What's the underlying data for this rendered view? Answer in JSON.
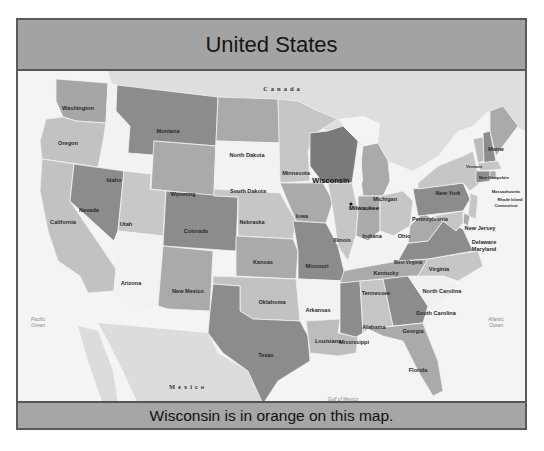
{
  "title": "United States",
  "caption": "Wisconsin is in orange on this map.",
  "highlight": {
    "state": "Wisconsin",
    "city": "Milwaukee"
  },
  "colors": {
    "frame_band": "#a3a3a3",
    "water": "#f4f4f4",
    "land_foreign": "#dcdcdc",
    "highlight": "#7a7a7a",
    "dark": "#8c8c8c",
    "mid": "#aaaaaa",
    "light": "#c4c4c4",
    "pale": "#f0f0f0"
  },
  "labels": {
    "countries": {
      "canada": "Canada",
      "mexico": "Mexico"
    },
    "water": {
      "pacific_1": "Pacific",
      "pacific_2": "Ocean",
      "atlantic_1": "Atlantic",
      "atlantic_2": "Ocean",
      "gulf": "Gulf of Mexico"
    },
    "states": {
      "washington": "Washington",
      "oregon": "Oregon",
      "california": "California",
      "idaho": "Idaho",
      "nevada": "Nevada",
      "utah": "Utah",
      "arizona": "Arizona",
      "montana": "Montana",
      "wyoming": "Wyoming",
      "colorado": "Colorado",
      "new_mexico": "New Mexico",
      "north_dakota": "North Dakota",
      "south_dakota": "South Dakota",
      "nebraska": "Nebraska",
      "kansas": "Kansas",
      "oklahoma": "Oklahoma",
      "texas": "Texas",
      "minnesota": "Minnesota",
      "iowa": "Iowa",
      "missouri": "Missouri",
      "arkansas": "Arkansas",
      "louisiana": "Louisiana",
      "wisconsin": "Wisconsin",
      "illinois": "Illinois",
      "michigan": "Michigan",
      "indiana": "Indiana",
      "ohio": "Ohio",
      "kentucky": "Kentucky",
      "tennessee": "Tennessee",
      "mississippi": "Mississippi",
      "alabama": "Alabama",
      "georgia": "Georgia",
      "florida": "Florida",
      "south_carolina": "South Carolina",
      "north_carolina": "North Carolina",
      "virginia": "Virginia",
      "west_virginia": "West Virginia",
      "pennsylvania": "Pennsylvania",
      "new_york": "New York",
      "new_jersey": "New Jersey",
      "delaware": "Delaware",
      "maryland": "Maryland",
      "vermont": "Vermont",
      "new_hampshire": "New Hampshire",
      "maine": "Maine",
      "massachusetts": "Massachusetts",
      "rhode_island": "Rhode Island",
      "connecticut": "Connecticut"
    },
    "cities": {
      "milwaukee": "Milwaukee"
    }
  }
}
